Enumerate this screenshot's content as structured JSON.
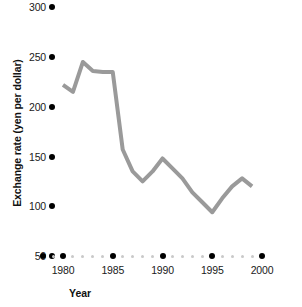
{
  "chart_data": {
    "type": "line",
    "title": "",
    "xlabel": "Year",
    "ylabel": "Exchange rate (yen per dollar)",
    "xlim": [
      1978,
      2000.5
    ],
    "ylim": [
      50,
      310
    ],
    "grid": false,
    "legend": false,
    "legend_position": "none",
    "line_color": "#9a9a9a",
    "line_width": 4,
    "x_major_ticks": [
      1980,
      1985,
      1990,
      1995,
      2000
    ],
    "x_minor_ticks": [
      1978,
      1979,
      1981,
      1982,
      1983,
      1984,
      1986,
      1987,
      1988,
      1989,
      1991,
      1992,
      1993,
      1994,
      1996,
      1997,
      1998,
      1999
    ],
    "x_tick_labels": [
      "1980",
      "1985",
      "1990",
      "1995",
      "2000"
    ],
    "y_ticks": [
      50,
      100,
      150,
      200,
      250,
      300
    ],
    "y_tick_labels": [
      "50",
      "100",
      "150",
      "200",
      "250",
      "300"
    ],
    "x": [
      1980,
      1981,
      1982,
      1983,
      1984,
      1985,
      1986,
      1987,
      1988,
      1989,
      1990,
      1991,
      1992,
      1993,
      1994,
      1995,
      1996,
      1997,
      1998,
      1999
    ],
    "values": [
      222,
      215,
      245,
      236,
      235,
      235,
      157,
      135,
      125,
      135,
      148,
      138,
      128,
      114,
      104,
      94,
      108,
      120,
      128,
      120
    ],
    "series": [
      {
        "name": "Exchange rate (yen per dollar)",
        "values": [
          222,
          215,
          245,
          236,
          235,
          235,
          157,
          135,
          125,
          135,
          148,
          138,
          128,
          114,
          104,
          94,
          108,
          120,
          128,
          120
        ]
      }
    ]
  },
  "axes": {
    "y_title": "Exchange rate (yen per dollar)",
    "x_title": "Year"
  },
  "colors": {
    "line": "#9a9a9a",
    "tick_major": "#000000",
    "tick_minor": "#c9c9c9",
    "text": "#1a1a1a",
    "background": "#ffffff"
  }
}
